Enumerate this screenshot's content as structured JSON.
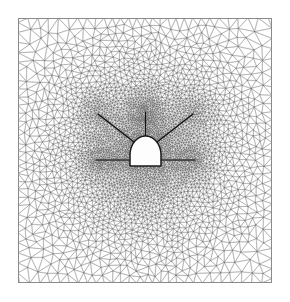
{
  "figure": {
    "type": "mesh-diagram",
    "width": 290,
    "height": 302,
    "background_color": "#ffffff",
    "caption": ""
  },
  "frame": {
    "name": "domain-boundary",
    "x": 18,
    "y": 18,
    "width": 254,
    "height": 265,
    "stroke_color": "#8a8a8a",
    "stroke_width": 1,
    "fill_color": "#ffffff"
  },
  "mesh": {
    "name": "triangular-mesh",
    "element_type": "triangle",
    "line_color": "#7a7a7a",
    "line_width": 0.35,
    "node_color": "#555555",
    "description": "Unstructured graded triangular mesh, refined toward the tunnel opening and around bolt anchor zones",
    "min_element_size_px": 1.4,
    "max_element_size_px": 11.0,
    "refinement_center_x": 145,
    "refinement_center_y": 150,
    "refinement_radius_px": 80,
    "coarse_grading_exponent": 1.55,
    "approx_node_count": 11800
  },
  "tunnel": {
    "name": "tunnel-opening",
    "shape": "horseshoe-arch",
    "center_x": 145.5,
    "crown_y": 136,
    "invert_y": 166,
    "half_width": 15.5,
    "wall_height": 11,
    "fill_color": "#fdfdfd",
    "stroke_color": "#1a1a1a",
    "stroke_width": 1.5
  },
  "bolts": {
    "name": "rock-bolt-set",
    "count": 5,
    "stroke_color": "#111111",
    "stroke_width": 1.2,
    "items": [
      {
        "label": "bolt-left-horizontal",
        "angle_deg": 180,
        "x1": 130.0,
        "y1": 160.0,
        "x2": 96.0,
        "y2": 160.0,
        "anchor_x": 96.0,
        "anchor_y": 160.0,
        "anchor_radius": 18
      },
      {
        "label": "bolt-upper-left-diagonal",
        "angle_deg": 138,
        "x1": 134.0,
        "y1": 142.0,
        "x2": 98.0,
        "y2": 114.0,
        "anchor_x": 95.0,
        "anchor_y": 111.0,
        "anchor_radius": 18
      },
      {
        "label": "bolt-crown-vertical",
        "angle_deg": 90,
        "x1": 145.5,
        "y1": 136.0,
        "x2": 145.5,
        "y2": 112.0,
        "anchor_x": 145.5,
        "anchor_y": 109.0,
        "anchor_radius": 18
      },
      {
        "label": "bolt-upper-right-diagonal",
        "angle_deg": 42,
        "x1": 157.0,
        "y1": 142.0,
        "x2": 193.0,
        "y2": 114.0,
        "anchor_x": 196.0,
        "anchor_y": 111.0,
        "anchor_radius": 18
      },
      {
        "label": "bolt-right-horizontal",
        "angle_deg": 0,
        "x1": 161.0,
        "y1": 160.0,
        "x2": 195.0,
        "y2": 160.0,
        "anchor_x": 195.0,
        "anchor_y": 160.0,
        "anchor_radius": 18
      }
    ]
  },
  "refinement_zones": {
    "name": "mesh-refinement-blobs",
    "note": "Darker dense patches marking locally refined mesh at bolt anchors",
    "shade_color": "#606060",
    "centers": [
      {
        "x": 96.0,
        "y": 160.0,
        "r": 17
      },
      {
        "x": 95.0,
        "y": 111.0,
        "r": 18
      },
      {
        "x": 145.5,
        "y": 109.0,
        "r": 17
      },
      {
        "x": 196.0,
        "y": 111.0,
        "r": 18
      },
      {
        "x": 195.0,
        "y": 160.0,
        "r": 17
      }
    ]
  },
  "chart_data": {
    "type": "mesh",
    "xlabel": "",
    "ylabel": "",
    "xlim": [
      18,
      272
    ],
    "ylim": [
      18,
      283
    ],
    "grid": false,
    "legend": "none",
    "annotations": []
  }
}
